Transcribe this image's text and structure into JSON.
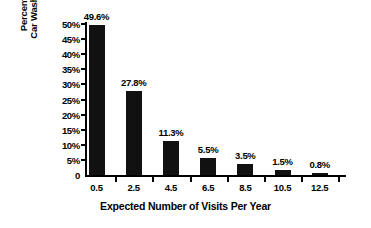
{
  "chart_data": {
    "type": "bar",
    "title": "",
    "xlabel": "Expected Number of Visits Per Year",
    "ylabel_lines": [
      "Percentage of",
      "Car Wash Buyers"
    ],
    "ylabel": "Percentage of Car Wash Buyers",
    "categories": [
      "0.5",
      "2.5",
      "4.5",
      "6.5",
      "8.5",
      "10.5",
      "12.5"
    ],
    "values": [
      49.6,
      27.8,
      11.3,
      5.5,
      3.5,
      1.5,
      0.8
    ],
    "data_labels": [
      "49.6%",
      "27.8%",
      "11.3%",
      "5.5%",
      "3.5%",
      "1.5%",
      "0.8%"
    ],
    "ytick_labels": [
      "50%",
      "45%",
      "40%",
      "35%",
      "30%",
      "25%",
      "20%",
      "15%",
      "10%",
      "5%",
      "0"
    ],
    "ytick_values": [
      50,
      45,
      40,
      35,
      30,
      25,
      20,
      15,
      10,
      5,
      0
    ],
    "ylim": [
      0,
      50
    ],
    "grid": false,
    "legend": false,
    "bar_color": "#111111",
    "background_color": "#ffffff",
    "axis_color": "#000000",
    "text_color": "#000000"
  }
}
